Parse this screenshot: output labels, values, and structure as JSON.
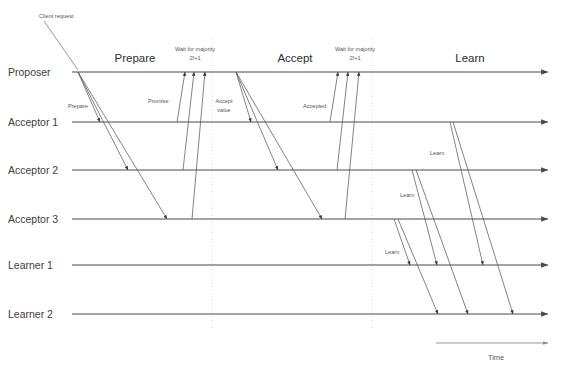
{
  "diagram": {
    "type": "sequence-diagram",
    "width": 564,
    "height": 371,
    "background_color": "#ffffff",
    "line_color": "#4a4a4a",
    "message_color": "#5a5a5a",
    "guide_color": "#cfcfcf"
  },
  "lanes": [
    {
      "id": "proposer",
      "label": "Proposer",
      "y": 72,
      "label_x": 8,
      "line_x1": 72,
      "line_x2": 548
    },
    {
      "id": "acceptor1",
      "label": "Acceptor 1",
      "y": 122,
      "label_x": 8,
      "line_x1": 72,
      "line_x2": 548
    },
    {
      "id": "acceptor2",
      "label": "Acceptor 2",
      "y": 170,
      "label_x": 8,
      "line_x1": 72,
      "line_x2": 548
    },
    {
      "id": "acceptor3",
      "label": "Acceptor 3",
      "y": 219,
      "label_x": 8,
      "line_x1": 72,
      "line_x2": 548
    },
    {
      "id": "learner1",
      "label": "Learner 1",
      "y": 265,
      "label_x": 8,
      "line_x1": 72,
      "line_x2": 548
    },
    {
      "id": "learner2",
      "label": "Learner 2",
      "y": 314,
      "label_x": 8,
      "line_x1": 72,
      "line_x2": 548
    }
  ],
  "phases": [
    {
      "id": "prepare",
      "label": "Prepare",
      "x": 135,
      "y": 62
    },
    {
      "id": "accept",
      "label": "Accept",
      "x": 295,
      "y": 62
    },
    {
      "id": "learn",
      "label": "Learn",
      "x": 470,
      "y": 62
    }
  ],
  "notes": [
    {
      "id": "wait-majority-1",
      "line1": "Wait for majority",
      "line2": "2f+1",
      "x": 195,
      "y1": 50,
      "y2": 59
    },
    {
      "id": "wait-majority-2",
      "line1": "Wait for majority",
      "line2": "2f+1",
      "x": 355,
      "y1": 50,
      "y2": 59
    }
  ],
  "callout": {
    "id": "client-request",
    "label": "Client request",
    "label_x": 39,
    "label_y": 16,
    "line": {
      "x1": 44,
      "y1": 20,
      "x2": 78,
      "y2": 70
    }
  },
  "guidelines": [
    {
      "id": "guide-prepare-end",
      "x": 212,
      "y1": 38,
      "y2": 330
    },
    {
      "id": "guide-accept-end",
      "x": 372,
      "y1": 38,
      "y2": 330
    }
  ],
  "message_labels": [
    {
      "id": "prepare-msg",
      "label": "Prepare",
      "x": 68,
      "y": 106
    },
    {
      "id": "promise-msg",
      "label": "Promise",
      "x": 148,
      "y": 101
    },
    {
      "id": "accept-value-msg",
      "line1": "Accept",
      "line2": "value",
      "x": 224,
      "y1": 101,
      "y2": 110
    },
    {
      "id": "accepted-msg",
      "label": "Accepted",
      "x": 303,
      "y": 106
    },
    {
      "id": "learn-msg-a1",
      "label": "Learn",
      "x": 430,
      "y": 153
    },
    {
      "id": "learn-msg-a2",
      "label": "Learn",
      "x": 400,
      "y": 195
    },
    {
      "id": "learn-msg-a3",
      "label": "Learn",
      "x": 385,
      "y": 252
    }
  ],
  "messages": [
    {
      "id": "prepare-to-a1",
      "group": "prepare",
      "from": "proposer",
      "to": "acceptor1",
      "x1": 78,
      "y1": 72,
      "x2": 100,
      "y2": 122
    },
    {
      "id": "prepare-to-a2",
      "group": "prepare",
      "from": "proposer",
      "to": "acceptor2",
      "x1": 78,
      "y1": 72,
      "x2": 128,
      "y2": 170
    },
    {
      "id": "prepare-to-a3",
      "group": "prepare",
      "from": "proposer",
      "to": "acceptor3",
      "x1": 78,
      "y1": 72,
      "x2": 167,
      "y2": 219
    },
    {
      "id": "promise-a1",
      "group": "promise",
      "from": "acceptor1",
      "to": "proposer",
      "x1": 177,
      "y1": 122,
      "x2": 185,
      "y2": 72
    },
    {
      "id": "promise-a2",
      "group": "promise",
      "from": "acceptor2",
      "to": "proposer",
      "x1": 183,
      "y1": 170,
      "x2": 194,
      "y2": 72
    },
    {
      "id": "promise-a3",
      "group": "promise",
      "from": "acceptor3",
      "to": "proposer",
      "x1": 192,
      "y1": 219,
      "x2": 205,
      "y2": 72
    },
    {
      "id": "accept-to-a1",
      "group": "accept",
      "from": "proposer",
      "to": "acceptor1",
      "x1": 236,
      "y1": 72,
      "x2": 251,
      "y2": 122
    },
    {
      "id": "accept-to-a2",
      "group": "accept",
      "from": "proposer",
      "to": "acceptor2",
      "x1": 236,
      "y1": 72,
      "x2": 278,
      "y2": 170
    },
    {
      "id": "accept-to-a3",
      "group": "accept",
      "from": "proposer",
      "to": "acceptor3",
      "x1": 236,
      "y1": 72,
      "x2": 322,
      "y2": 219
    },
    {
      "id": "accepted-a1",
      "group": "accepted",
      "from": "acceptor1",
      "to": "proposer",
      "x1": 330,
      "y1": 122,
      "x2": 338,
      "y2": 72
    },
    {
      "id": "accepted-a2",
      "group": "accepted",
      "from": "acceptor2",
      "to": "proposer",
      "x1": 337,
      "y1": 170,
      "x2": 348,
      "y2": 72
    },
    {
      "id": "accepted-a3",
      "group": "accepted",
      "from": "acceptor3",
      "to": "proposer",
      "x1": 345,
      "y1": 219,
      "x2": 359,
      "y2": 72
    },
    {
      "id": "learn-a1-l1",
      "group": "learn",
      "from": "acceptor1",
      "to": "learner1",
      "x1": 450,
      "y1": 122,
      "x2": 483,
      "y2": 265
    },
    {
      "id": "learn-a1-l2",
      "group": "learn",
      "from": "acceptor1",
      "to": "learner2",
      "x1": 453,
      "y1": 122,
      "x2": 513,
      "y2": 314
    },
    {
      "id": "learn-a2-l1",
      "group": "learn",
      "from": "acceptor2",
      "to": "learner1",
      "x1": 412,
      "y1": 170,
      "x2": 437,
      "y2": 265
    },
    {
      "id": "learn-a2-l2",
      "group": "learn",
      "from": "acceptor2",
      "to": "learner2",
      "x1": 416,
      "y1": 170,
      "x2": 468,
      "y2": 314
    },
    {
      "id": "learn-a3-l1",
      "group": "learn",
      "from": "acceptor3",
      "to": "learner1",
      "x1": 394,
      "y1": 219,
      "x2": 410,
      "y2": 265
    },
    {
      "id": "learn-a3-l2",
      "group": "learn",
      "from": "acceptor3",
      "to": "learner2",
      "x1": 398,
      "y1": 219,
      "x2": 438,
      "y2": 314
    }
  ],
  "time_axis": {
    "label": "Time",
    "label_x": 496,
    "label_y": 358,
    "x1": 436,
    "x2": 548,
    "y": 343
  }
}
